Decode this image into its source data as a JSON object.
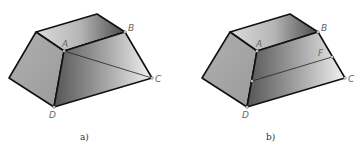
{
  "figures": [
    {
      "id": "a",
      "caption": "a)",
      "vertices": {
        "A": "A",
        "B": "B",
        "C": "C",
        "D": "D"
      },
      "description": "Frustum with diagonal line from A to C on the front-right face"
    },
    {
      "id": "b",
      "caption": "b)",
      "vertices": {
        "A": "A",
        "B": "B",
        "C": "C",
        "D": "D",
        "E": "E",
        "F": "F"
      },
      "description": "Frustum with line EF parallel across the front-right face, E on AD and F on BC"
    }
  ],
  "colors": {
    "edge": "#111111",
    "label": "#666666",
    "background": "#ffffff"
  }
}
